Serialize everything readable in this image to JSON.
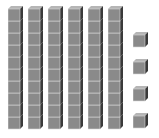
{
  "diagram": {
    "type": "base-ten-blocks",
    "tens_rods": 6,
    "cubes_per_rod": 10,
    "ones_cubes": 4,
    "represented_value": 64,
    "colors": {
      "front": "#8a8a8a",
      "top": "#b5b5b5",
      "side": "#3a3a3a",
      "edge": "#d8d8d8"
    }
  }
}
